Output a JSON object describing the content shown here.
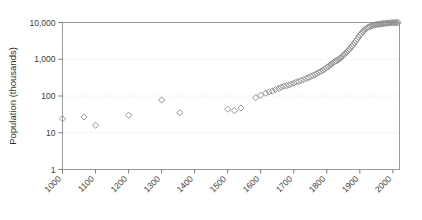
{
  "chart_data": {
    "type": "scatter",
    "title": "",
    "xlabel": "",
    "ylabel": "Population (thousands)",
    "yscale": "log",
    "ylim": [
      1,
      10000
    ],
    "xlim": [
      1000,
      2020
    ],
    "grid": "horizontal-dotted",
    "legend": "none",
    "marker": "open-diamond",
    "marker_color": "#8a8a8a",
    "ytick_labels": [
      "1",
      "10",
      "100",
      "1,000",
      "10,000"
    ],
    "ytick_values": [
      1,
      10,
      100,
      1000,
      10000
    ],
    "xtick_labels": [
      "1000",
      "1100",
      "1200",
      "1300",
      "1400",
      "1500",
      "1600",
      "1700",
      "1800",
      "1900",
      "2000"
    ],
    "xtick_values": [
      1000,
      1100,
      1200,
      1300,
      1400,
      1500,
      1600,
      1700,
      1800,
      1900,
      2000
    ],
    "series": [
      {
        "name": "Population",
        "points": [
          [
            1000,
            24
          ],
          [
            1065,
            27
          ],
          [
            1100,
            16
          ],
          [
            1200,
            30
          ],
          [
            1300,
            78
          ],
          [
            1355,
            35
          ],
          [
            1500,
            44
          ],
          [
            1520,
            40
          ],
          [
            1540,
            47
          ],
          [
            1585,
            90
          ],
          [
            1600,
            105
          ],
          [
            1615,
            120
          ],
          [
            1625,
            130
          ],
          [
            1635,
            135
          ],
          [
            1645,
            150
          ],
          [
            1655,
            160
          ],
          [
            1662,
            175
          ],
          [
            1670,
            185
          ],
          [
            1678,
            190
          ],
          [
            1685,
            200
          ],
          [
            1692,
            210
          ],
          [
            1700,
            225
          ],
          [
            1708,
            240
          ],
          [
            1715,
            250
          ],
          [
            1722,
            265
          ],
          [
            1730,
            280
          ],
          [
            1738,
            300
          ],
          [
            1745,
            320
          ],
          [
            1752,
            340
          ],
          [
            1758,
            360
          ],
          [
            1764,
            385
          ],
          [
            1770,
            410
          ],
          [
            1776,
            440
          ],
          [
            1782,
            470
          ],
          [
            1788,
            500
          ],
          [
            1793,
            540
          ],
          [
            1798,
            580
          ],
          [
            1803,
            620
          ],
          [
            1808,
            670
          ],
          [
            1812,
            720
          ],
          [
            1816,
            760
          ],
          [
            1820,
            810
          ],
          [
            1824,
            860
          ],
          [
            1828,
            900
          ],
          [
            1832,
            950
          ],
          [
            1836,
            1000
          ],
          [
            1840,
            1060
          ],
          [
            1844,
            1130
          ],
          [
            1848,
            1220
          ],
          [
            1852,
            1320
          ],
          [
            1856,
            1430
          ],
          [
            1860,
            1560
          ],
          [
            1864,
            1700
          ],
          [
            1868,
            1860
          ],
          [
            1872,
            2050
          ],
          [
            1876,
            2250
          ],
          [
            1880,
            2500
          ],
          [
            1884,
            2800
          ],
          [
            1888,
            3150
          ],
          [
            1892,
            3550
          ],
          [
            1896,
            4000
          ],
          [
            1900,
            4500
          ],
          [
            1904,
            5000
          ],
          [
            1908,
            5500
          ],
          [
            1912,
            6000
          ],
          [
            1916,
            6500
          ],
          [
            1920,
            6900
          ],
          [
            1924,
            7300
          ],
          [
            1928,
            7600
          ],
          [
            1932,
            7900
          ],
          [
            1936,
            8150
          ],
          [
            1940,
            8400
          ],
          [
            1944,
            8550
          ],
          [
            1948,
            8700
          ],
          [
            1952,
            8850
          ],
          [
            1956,
            8950
          ],
          [
            1960,
            9050
          ],
          [
            1964,
            9150
          ],
          [
            1968,
            9250
          ],
          [
            1972,
            9350
          ],
          [
            1976,
            9450
          ],
          [
            1980,
            9550
          ],
          [
            1984,
            9620
          ],
          [
            1988,
            9680
          ],
          [
            1992,
            9740
          ],
          [
            1996,
            9800
          ],
          [
            2000,
            9850
          ],
          [
            2004,
            9900
          ],
          [
            2008,
            9930
          ],
          [
            2012,
            9960
          ],
          [
            2016,
            9980
          ]
        ]
      }
    ]
  }
}
